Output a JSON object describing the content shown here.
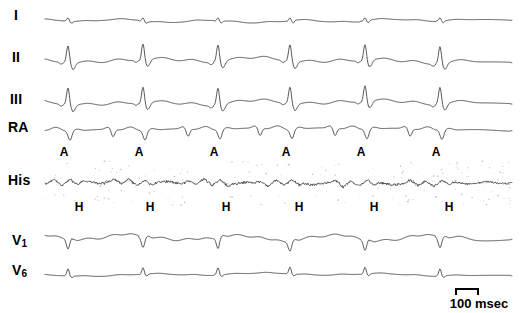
{
  "figure": {
    "type": "electrophysiology-recording",
    "width": 521,
    "height": 313,
    "background": "#ffffff",
    "trace_color": "#3a3a3a",
    "noise_color": "#9a9a9a",
    "label_color": "#000000",
    "trace_x_start": 45,
    "trace_x_end": 512
  },
  "channels": [
    {
      "label": "I",
      "name": "lead-i",
      "label_x": 14,
      "label_y": 8,
      "baseline_y": 21,
      "amplitude": 1.0,
      "noise": 0,
      "morphology": "flat-small-qrs"
    },
    {
      "label": "II",
      "name": "lead-ii",
      "label_x": 12,
      "label_y": 50,
      "baseline_y": 62,
      "amplitude": 1.0,
      "noise": 0,
      "morphology": "tall-r-wave"
    },
    {
      "label": "III",
      "name": "lead-iii",
      "label_x": 10,
      "label_y": 92,
      "baseline_y": 104,
      "amplitude": 1.0,
      "noise": 0,
      "morphology": "tall-r-wave"
    },
    {
      "label": "RA",
      "name": "right-atrial-electrogram",
      "label_x": 8,
      "label_y": 120,
      "baseline_y": 130,
      "amplitude": 1.0,
      "noise": 0,
      "morphology": "atrial-negative-spike"
    },
    {
      "label": "His",
      "name": "his-bundle-electrogram",
      "label_x": 8,
      "label_y": 173,
      "baseline_y": 183,
      "amplitude": 1.0,
      "noise": 1,
      "morphology": "his-noisy"
    },
    {
      "label": "V",
      "sublabel": "1",
      "name": "lead-v1",
      "label_x": 12,
      "label_y": 233,
      "baseline_y": 240,
      "amplitude": 1.0,
      "noise": 0,
      "morphology": "v1-qs"
    },
    {
      "label": "V",
      "sublabel": "6",
      "name": "lead-v6",
      "label_x": 12,
      "label_y": 263,
      "baseline_y": 275,
      "amplitude": 1.0,
      "noise": 0,
      "morphology": "v6-small-r"
    }
  ],
  "beat_x_positions": [
    68,
    143,
    218,
    290,
    365,
    440
  ],
  "annotations": {
    "atrial": {
      "symbol": "A",
      "name": "atrial-deflection-marker",
      "y": 146,
      "x_positions": [
        64,
        139,
        214,
        286,
        361,
        436
      ]
    },
    "his": {
      "symbol": "H",
      "name": "his-deflection-marker",
      "y": 201,
      "x_positions": [
        79,
        150,
        226,
        299,
        374,
        449
      ]
    }
  },
  "scalebar": {
    "label": "100 msec",
    "name": "time-scale-bar",
    "duration_ms": 100,
    "pixel_length": 24
  }
}
